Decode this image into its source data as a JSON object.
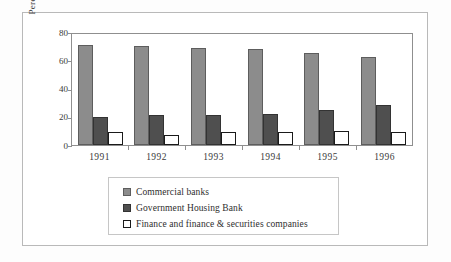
{
  "chart_data": {
    "type": "bar",
    "title": "",
    "xlabel": "",
    "ylabel": "Percentage Share",
    "ylim": [
      0,
      80
    ],
    "yticks": [
      "0",
      "20",
      "40",
      "60",
      "80"
    ],
    "grid": false,
    "legend_position": "below-plot",
    "categories": [
      "1991",
      "1992",
      "1993",
      "1994",
      "1995",
      "1996"
    ],
    "series": [
      {
        "name": "Commercial banks",
        "color": "#8c8c8c",
        "values": [
          71,
          70,
          69,
          68,
          65,
          62
        ]
      },
      {
        "name": "Government Housing Bank",
        "color": "#4f4f4f",
        "values": [
          20,
          21,
          21,
          22,
          25,
          28
        ]
      },
      {
        "name": "Finance and finance & securities companies",
        "color": "#ffffff",
        "values": [
          9,
          7,
          9,
          9.5,
          10,
          9.5
        ]
      }
    ]
  }
}
